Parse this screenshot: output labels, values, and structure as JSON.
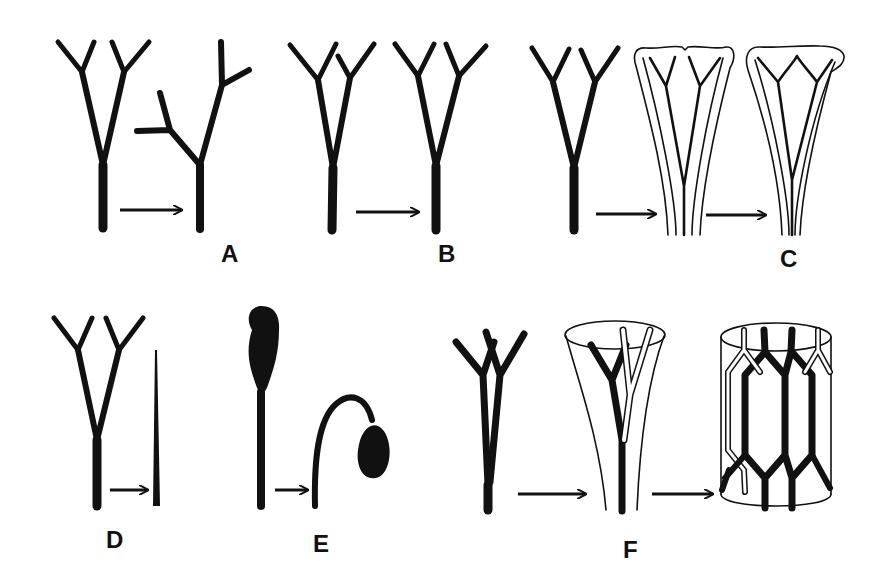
{
  "figure": {
    "panels": [
      {
        "id": "A",
        "label": "A",
        "description": "Y-shaped dichotomous branching telome truss becomes overtopped (one branch dominant, lateral branches)"
      },
      {
        "id": "B",
        "label": "B",
        "description": "Planation: branches rearranged into a single plane"
      },
      {
        "id": "C",
        "label": "C",
        "description": "Webbing: branches fused by lamina into a leaf with dichotomous venation"
      },
      {
        "id": "D",
        "label": "D",
        "description": "Reduction: branched system reduced to a single unbranched axis"
      },
      {
        "id": "E",
        "label": "E",
        "description": "Recurvation: erect stalk with terminal sporangium bends downward"
      },
      {
        "id": "F",
        "label": "F",
        "description": "Syngenesis: branches fused laterally into a cylindrical stele with network"
      }
    ],
    "arrow_glyph": "right-arrow",
    "colors": {
      "ink": "#111111",
      "background": "#ffffff"
    }
  }
}
